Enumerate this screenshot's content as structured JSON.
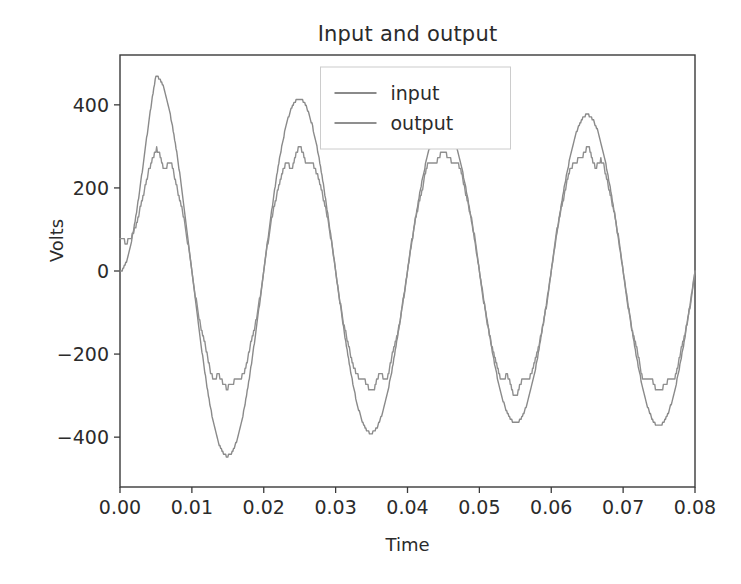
{
  "figure": {
    "title": "Input and output",
    "background_color": "#ffffff",
    "axes_color": "#3a3a3a"
  },
  "axes": {
    "x_label": "Time",
    "y_label": "Volts",
    "x_ticks": [
      "0.00",
      "0.01",
      "0.02",
      "0.03",
      "0.04",
      "0.05",
      "0.06",
      "0.07",
      "0.08"
    ],
    "y_ticks": [
      "400",
      "200",
      "0",
      "−200",
      "−400"
    ]
  },
  "legend": {
    "position": "upper center",
    "entries": [
      {
        "label": "input",
        "color": "#8a8a8a"
      },
      {
        "label": "output",
        "color": "#8f8f8f"
      }
    ]
  },
  "chart_data": {
    "type": "line",
    "title": "Input and output",
    "xlabel": "Time",
    "ylabel": "Volts",
    "xlim": [
      0.0,
      0.08
    ],
    "ylim": [
      -520,
      520
    ],
    "grid": false,
    "legend_position": "upper center",
    "x_ticks": [
      0.0,
      0.01,
      0.02,
      0.03,
      0.04,
      0.05,
      0.06,
      0.07,
      0.08
    ],
    "y_ticks": [
      400,
      200,
      0,
      -200,
      -400
    ],
    "sampling": {
      "n_points": 801,
      "dt": 0.0001
    },
    "series": [
      {
        "name": "input",
        "color": "#8a8a8a",
        "linewidth": 1.4,
        "model": "envelope_sine",
        "carrier_frequency_hz": 50,
        "phase_offset_rad": 0.0,
        "dc_start": 0,
        "envelope_points": [
          {
            "t": 0.0,
            "amplitude": 0
          },
          {
            "t": 0.005,
            "amplitude": 470
          },
          {
            "t": 0.015,
            "amplitude": 445
          },
          {
            "t": 0.025,
            "amplitude": 415
          },
          {
            "t": 0.035,
            "amplitude": 390
          },
          {
            "t": 0.045,
            "amplitude": 352
          },
          {
            "t": 0.055,
            "amplitude": 365
          },
          {
            "t": 0.065,
            "amplitude": 376
          },
          {
            "t": 0.075,
            "amplitude": 372
          },
          {
            "t": 0.08,
            "amplitude": 370
          }
        ],
        "key_extrema": [
          {
            "t": 0.0045,
            "v": 470,
            "kind": "peak"
          },
          {
            "t": 0.0145,
            "v": -445,
            "kind": "trough"
          },
          {
            "t": 0.0243,
            "v": 415,
            "kind": "peak"
          },
          {
            "t": 0.0343,
            "v": -390,
            "kind": "trough"
          },
          {
            "t": 0.0443,
            "v": 350,
            "kind": "peak"
          },
          {
            "t": 0.0548,
            "v": -365,
            "kind": "trough"
          },
          {
            "t": 0.065,
            "v": 376,
            "kind": "peak"
          },
          {
            "t": 0.0752,
            "v": -372,
            "kind": "trough"
          }
        ]
      },
      {
        "name": "output",
        "color": "#8f8f8f",
        "linewidth": 1.4,
        "model": "quantized_ripple_sine",
        "carrier_frequency_hz": 50,
        "phase_offset_rad": 0.0,
        "start_value": 80,
        "quantization_step_volts": 13,
        "ripple_frequency_hz": 450,
        "ripple_amplitude_volts": 34,
        "clip_magnitude_volts": 345,
        "envelope_points": [
          {
            "t": 0.0,
            "amplitude": 80
          },
          {
            "t": 0.005,
            "amplitude": 345
          },
          {
            "t": 0.015,
            "amplitude": 335
          },
          {
            "t": 0.025,
            "amplitude": 345
          },
          {
            "t": 0.035,
            "amplitude": 340
          },
          {
            "t": 0.045,
            "amplitude": 345
          },
          {
            "t": 0.055,
            "amplitude": 350
          },
          {
            "t": 0.065,
            "amplitude": 355
          },
          {
            "t": 0.075,
            "amplitude": 352
          },
          {
            "t": 0.08,
            "amplitude": 350
          }
        ],
        "key_extrema": [
          {
            "t": 0.0045,
            "v": 345,
            "kind": "peak"
          },
          {
            "t": 0.0145,
            "v": -330,
            "kind": "trough"
          },
          {
            "t": 0.0245,
            "v": 345,
            "kind": "peak"
          },
          {
            "t": 0.0345,
            "v": -335,
            "kind": "trough"
          },
          {
            "t": 0.0445,
            "v": 350,
            "kind": "peak"
          },
          {
            "t": 0.055,
            "v": -345,
            "kind": "trough"
          },
          {
            "t": 0.065,
            "v": 355,
            "kind": "peak"
          },
          {
            "t": 0.0752,
            "v": -350,
            "kind": "trough"
          }
        ]
      }
    ]
  },
  "geometry": {
    "plot_left": 120,
    "plot_right": 695,
    "plot_top": 55,
    "plot_bottom": 487
  }
}
